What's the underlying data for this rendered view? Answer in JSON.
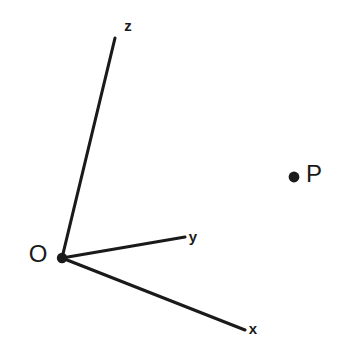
{
  "diagram": {
    "background_color": "#ffffff",
    "stroke_color": "#1a1a1a",
    "width": 348,
    "height": 358,
    "origin": {
      "label": "O",
      "dot_x": 62,
      "dot_y": 258,
      "dot_radius": 5.2,
      "label_x": 38,
      "label_y": 256
    },
    "axes": [
      {
        "name": "z",
        "label": "z",
        "x1": 62,
        "y1": 258,
        "x2": 115,
        "y2": 38,
        "label_x": 128,
        "label_y": 27
      },
      {
        "name": "y",
        "label": "y",
        "x1": 62,
        "y1": 258,
        "x2": 185,
        "y2": 237,
        "label_x": 193,
        "label_y": 238
      },
      {
        "name": "x",
        "label": "x",
        "x1": 62,
        "y1": 258,
        "x2": 245,
        "y2": 330,
        "label_x": 253,
        "label_y": 330
      }
    ],
    "points": [
      {
        "name": "P",
        "label": "P",
        "dot_x": 294,
        "dot_y": 177,
        "dot_radius": 5.4,
        "label_x": 314,
        "label_y": 176
      }
    ]
  },
  "chart_data": {
    "type": "scatter",
    "xlabel": "x",
    "ylabel": "y",
    "zlabel": "z",
    "axis_labels": [
      "z",
      "y",
      "x"
    ],
    "origin_label": "O",
    "point_labels": [
      "P"
    ],
    "grid": false,
    "legend": null,
    "annotations": [
      "O",
      "z",
      "y",
      "x",
      "P"
    ]
  }
}
